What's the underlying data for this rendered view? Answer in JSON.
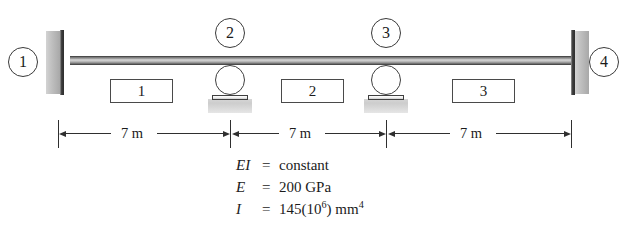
{
  "figure": {
    "type": "continuous-beam-diagram"
  },
  "nodes": [
    {
      "label": "1",
      "support": "fixed"
    },
    {
      "label": "2",
      "support": "roller"
    },
    {
      "label": "3",
      "support": "roller"
    },
    {
      "label": "4",
      "support": "fixed"
    }
  ],
  "members": [
    {
      "label": "1"
    },
    {
      "label": "2"
    },
    {
      "label": "3"
    }
  ],
  "dimensions": [
    {
      "label": "7 m"
    },
    {
      "label": "7 m"
    },
    {
      "label": "7 m"
    }
  ],
  "properties": [
    {
      "symbol": "EI",
      "eq": "=",
      "value": "constant"
    },
    {
      "symbol": "E",
      "eq": "=",
      "value": "200 GPa"
    },
    {
      "symbol": "I",
      "eq": "=",
      "value": "145(10<sup>6</sup>) mm<sup>4</sup>"
    }
  ],
  "colors": {
    "ink": "#1b1b1b",
    "line": "#2f2f2f",
    "hatch": "#c2c2c2",
    "beam_dark": "#5c5c5c",
    "beam_light": "#d8d8d8"
  }
}
